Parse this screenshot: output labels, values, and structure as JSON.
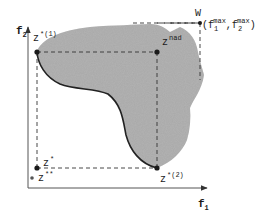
{
  "diagram": {
    "type": "objective-space",
    "colors": {
      "region_fill": "#a9a9a9",
      "pareto_front": "#222222",
      "axis": "#555555",
      "guide": "#333333",
      "point": "#1a1a1a",
      "background": "#ffffff"
    },
    "axes": {
      "x": {
        "label": "f",
        "sub": "1"
      },
      "y": {
        "label": "f",
        "sub": "2"
      }
    },
    "points": {
      "z_star_1": {
        "label": "z",
        "sup": "*(1)"
      },
      "z_nad": {
        "label": "z",
        "sup": "nad"
      },
      "w": {
        "label": "W",
        "paren_open": "(",
        "f1": "f",
        "f1_sub": "1",
        "f1_sup": "max",
        "comma": ",",
        "f2": "f",
        "f2_sub": "2",
        "f2_sup": "max",
        "paren_close": ")"
      },
      "z_star_2": {
        "label": "z",
        "sup": "*(2)"
      },
      "z_star": {
        "label": "z",
        "sup": "*"
      },
      "z_star_star": {
        "label": "z",
        "sup": "**"
      }
    }
  }
}
